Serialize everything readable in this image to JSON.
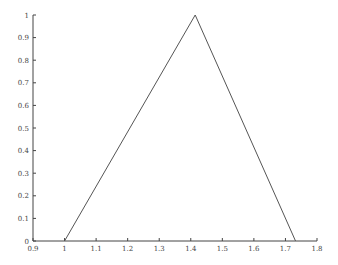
{
  "chart_data": {
    "type": "line",
    "title": "",
    "xlabel": "",
    "ylabel": "",
    "xlim": [
      0.9,
      1.8
    ],
    "ylim": [
      0,
      1
    ],
    "grid": false,
    "legend": null,
    "x_ticks": [
      "0.9",
      "1",
      "1.1",
      "1.2",
      "1.3",
      "1.4",
      "1.5",
      "1.6",
      "1.7",
      "1.8"
    ],
    "y_ticks": [
      "0",
      "0.1",
      "0.2",
      "0.3",
      "0.4",
      "0.5",
      "0.6",
      "0.7",
      "0.8",
      "0.9",
      "1"
    ],
    "series": [
      {
        "name": "triangle",
        "color": "#555555",
        "x": [
          1.0,
          1.414,
          1.732
        ],
        "y": [
          0,
          1,
          0
        ]
      }
    ]
  }
}
